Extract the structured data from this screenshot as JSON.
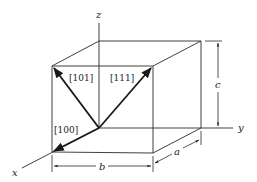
{
  "figure": {
    "type": "unit-cell-direction-diagram",
    "axes": {
      "x": "x",
      "y": "y",
      "z": "z"
    },
    "directions": [
      {
        "label": "[100]"
      },
      {
        "label": "[101]"
      },
      {
        "label": "[111]"
      }
    ],
    "dimensions": {
      "a": "a",
      "b": "b",
      "c": "c"
    },
    "colors": {
      "line": "#2a2a2a",
      "background": "#ffffff"
    }
  }
}
